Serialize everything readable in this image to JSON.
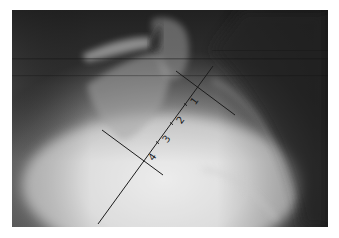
{
  "image": {
    "kind": "lateral radiograph with measurement overlay",
    "background_color": "#ffffff",
    "frame": {
      "left": 12,
      "top": 10,
      "width": 316,
      "height": 217
    }
  },
  "overlay": {
    "line_color": "#1c1c1c",
    "main_axis": {
      "x1": 98,
      "y1": 224,
      "x2": 213,
      "y2": 66
    },
    "upper_perpendicular": {
      "x1": 176,
      "y1": 71,
      "x2": 235,
      "y2": 115
    },
    "lower_perpendicular": {
      "x1": 102,
      "y1": 130,
      "x2": 163,
      "y2": 175
    },
    "segment_labels": [
      {
        "text": "1",
        "x": 197,
        "y": 103,
        "rotate": -54
      },
      {
        "text": "2",
        "x": 183,
        "y": 122,
        "rotate": -54
      },
      {
        "text": "3",
        "x": 169,
        "y": 141,
        "rotate": -54
      },
      {
        "text": "4",
        "x": 155,
        "y": 159,
        "rotate": -54
      }
    ],
    "tick_marks": [
      {
        "x": 186,
        "y": 105
      },
      {
        "x": 172,
        "y": 124
      },
      {
        "x": 158,
        "y": 143
      }
    ]
  }
}
